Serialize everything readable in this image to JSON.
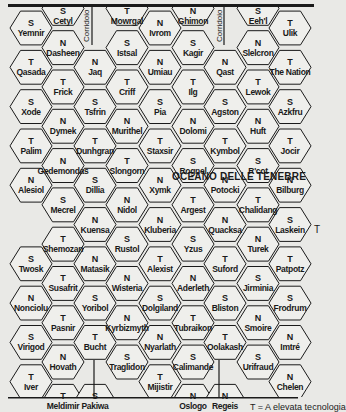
{
  "map": {
    "title": "OCEANO DELLE TENEBRE",
    "corridor_label": "Corridoio",
    "side_marker": "T",
    "legend": "T = A elevata tecnologia",
    "colors": {
      "background": "#e9e9e6",
      "hex_fill": "#efefec",
      "line": "#1a1a1a"
    },
    "hexes": [
      {
        "col": 0,
        "row": 0,
        "type": "S",
        "name": "Yemnir"
      },
      {
        "col": 0,
        "row": 1,
        "type": "T",
        "name": "Qasada"
      },
      {
        "col": 0,
        "row": 2,
        "type": "S",
        "name": "Xode"
      },
      {
        "col": 0,
        "row": 3,
        "type": "T",
        "name": "Palim"
      },
      {
        "col": 0,
        "row": 4,
        "type": "N",
        "name": "Alesiol"
      },
      {
        "col": 0,
        "row": 6,
        "type": "S",
        "name": "Twosk"
      },
      {
        "col": 0,
        "row": 7,
        "type": "N",
        "name": "Nonciolu"
      },
      {
        "col": 0,
        "row": 8,
        "type": "S",
        "name": "Virigod"
      },
      {
        "col": 0,
        "row": 9,
        "type": "T",
        "name": "Iver"
      },
      {
        "col": 1,
        "row": -0.5,
        "type": "S",
        "name": "Cetyl"
      },
      {
        "col": 1,
        "row": 0.5,
        "type": "N",
        "name": "Dasheen"
      },
      {
        "col": 1,
        "row": 1.5,
        "type": "T",
        "name": "Frick"
      },
      {
        "col": 1,
        "row": 2.5,
        "type": "N",
        "name": "Dymek"
      },
      {
        "col": 1,
        "row": 3.5,
        "type": "N",
        "name": "Gedemondas"
      },
      {
        "col": 1,
        "row": 4.5,
        "type": "S",
        "name": "Mecrel"
      },
      {
        "col": 1,
        "row": 5.5,
        "type": "T",
        "name": "Shemozan"
      },
      {
        "col": 1,
        "row": 6.5,
        "type": "T",
        "name": "Susafrit"
      },
      {
        "col": 1,
        "row": 7.5,
        "type": "T",
        "name": "Pasnir"
      },
      {
        "col": 1,
        "row": 8.5,
        "type": "N",
        "name": "Hovath"
      },
      {
        "col": 1,
        "row": 9.5,
        "type": "T",
        "name": "Meldimir"
      },
      {
        "col": 2,
        "row": 1,
        "type": "N",
        "name": "Jaq"
      },
      {
        "col": 2,
        "row": 2,
        "type": "S",
        "name": "Tsfrin"
      },
      {
        "col": 2,
        "row": 3,
        "type": "T",
        "name": "Dunhgran"
      },
      {
        "col": 2,
        "row": 4,
        "type": "S",
        "name": "Dillia"
      },
      {
        "col": 2,
        "row": 5,
        "type": "N",
        "name": "Kuensa"
      },
      {
        "col": 2,
        "row": 6,
        "type": "N",
        "name": "Matasik"
      },
      {
        "col": 2,
        "row": 7,
        "type": "S",
        "name": "Yoribol"
      },
      {
        "col": 2,
        "row": 8,
        "type": "T",
        "name": "Bucht"
      },
      {
        "col": 2,
        "row": 9.5,
        "type": "S",
        "name": "Pakiwa"
      },
      {
        "col": 3,
        "row": -0.5,
        "type": "T",
        "name": "Mowrgal"
      },
      {
        "col": 3,
        "row": 0.5,
        "type": "S",
        "name": "Istsal"
      },
      {
        "col": 3,
        "row": 1.5,
        "type": "T",
        "name": "Criff"
      },
      {
        "col": 3,
        "row": 2.5,
        "type": "N",
        "name": "Murithel"
      },
      {
        "col": 3,
        "row": 3.5,
        "type": "T",
        "name": "Slongorn"
      },
      {
        "col": 3,
        "row": 4.5,
        "type": "N",
        "name": "Nidol"
      },
      {
        "col": 3,
        "row": 5.5,
        "type": "S",
        "name": "Rustol"
      },
      {
        "col": 3,
        "row": 6.5,
        "type": "N",
        "name": "Wisteria"
      },
      {
        "col": 3,
        "row": 7.5,
        "type": "N",
        "name": "Kyrbizmyth"
      },
      {
        "col": 3,
        "row": 8.5,
        "type": "S",
        "name": "Traglidon"
      },
      {
        "col": 4,
        "row": 0,
        "type": "N",
        "name": "Ivrom"
      },
      {
        "col": 4,
        "row": 1,
        "type": "N",
        "name": "Umiau"
      },
      {
        "col": 4,
        "row": 2,
        "type": "S",
        "name": "Pia"
      },
      {
        "col": 4,
        "row": 3,
        "type": "T",
        "name": "Staxsir"
      },
      {
        "col": 4,
        "row": 4,
        "type": "N",
        "name": "Xymk"
      },
      {
        "col": 4,
        "row": 5,
        "type": "N",
        "name": "Kluberia"
      },
      {
        "col": 4,
        "row": 6,
        "type": "T",
        "name": "Alexist"
      },
      {
        "col": 4,
        "row": 7,
        "type": "S",
        "name": "Dolgiland"
      },
      {
        "col": 4,
        "row": 8,
        "type": "N",
        "name": "Nyarlath"
      },
      {
        "col": 4,
        "row": 9,
        "type": "T",
        "name": "Mijistir"
      },
      {
        "col": 5,
        "row": -0.5,
        "type": "N",
        "name": "Ghimon"
      },
      {
        "col": 5,
        "row": 0.5,
        "type": "S",
        "name": "Kagir"
      },
      {
        "col": 5,
        "row": 1.5,
        "type": "T",
        "name": "Ilg"
      },
      {
        "col": 5,
        "row": 2.5,
        "type": "N",
        "name": "Dolomi"
      },
      {
        "col": 5,
        "row": 3.5,
        "type": "S",
        "name": "Rognel"
      },
      {
        "col": 5,
        "row": 4.5,
        "type": "T",
        "name": "Argest"
      },
      {
        "col": 5,
        "row": 5.5,
        "type": "S",
        "name": "Yzus"
      },
      {
        "col": 5,
        "row": 6.5,
        "type": "N",
        "name": "Aderleth"
      },
      {
        "col": 5,
        "row": 7.5,
        "type": "T",
        "name": "Tubraikon"
      },
      {
        "col": 5,
        "row": 8.5,
        "type": "S",
        "name": "Calimande"
      },
      {
        "col": 5,
        "row": 9.5,
        "type": "N",
        "name": "Oslogo"
      },
      {
        "col": 6,
        "row": 1,
        "type": "N",
        "name": "Qast"
      },
      {
        "col": 6,
        "row": 2,
        "type": "S",
        "name": "Agston"
      },
      {
        "col": 6,
        "row": 3,
        "type": "T",
        "name": "Kymbol"
      },
      {
        "col": 6,
        "row": 4,
        "type": "N",
        "name": "Potocki"
      },
      {
        "col": 6,
        "row": 5,
        "type": "N",
        "name": "Quacksa"
      },
      {
        "col": 6,
        "row": 6,
        "type": "T",
        "name": "Suford"
      },
      {
        "col": 6,
        "row": 7,
        "type": "S",
        "name": "Bliston"
      },
      {
        "col": 6,
        "row": 8,
        "type": "T",
        "name": "Oolakash"
      },
      {
        "col": 6,
        "row": 9.5,
        "type": "N",
        "name": "Regeis"
      },
      {
        "col": 7,
        "row": -0.5,
        "type": "S",
        "name": "Eeh'l"
      },
      {
        "col": 7,
        "row": 0.5,
        "type": "N",
        "name": "Slelcron"
      },
      {
        "col": 7,
        "row": 1.5,
        "type": "T",
        "name": "Lewok"
      },
      {
        "col": 7,
        "row": 2.5,
        "type": "N",
        "name": "Huft"
      },
      {
        "col": 7,
        "row": 3.5,
        "type": "S",
        "name": "R'cot"
      },
      {
        "col": 7,
        "row": 4.5,
        "type": "T",
        "name": "Chalidang"
      },
      {
        "col": 7,
        "row": 5.5,
        "type": "N",
        "name": "Turek"
      },
      {
        "col": 7,
        "row": 6.5,
        "type": "S",
        "name": "Jirminia"
      },
      {
        "col": 7,
        "row": 7.5,
        "type": "N",
        "name": "Smoire"
      },
      {
        "col": 7,
        "row": 8.5,
        "type": "S",
        "name": "Urifraud"
      },
      {
        "col": 8,
        "row": 0,
        "type": "T",
        "name": "Ulik"
      },
      {
        "col": 8,
        "row": 1,
        "type": "T",
        "name": "The Nation"
      },
      {
        "col": 8,
        "row": 2,
        "type": "S",
        "name": "Azkfru"
      },
      {
        "col": 8,
        "row": 3,
        "type": "T",
        "name": "Jocir"
      },
      {
        "col": 8,
        "row": 4,
        "type": "N",
        "name": "Bilburg"
      },
      {
        "col": 8,
        "row": 5,
        "type": "S",
        "name": "Laskein"
      },
      {
        "col": 8,
        "row": 6,
        "type": "T",
        "name": "Patpotz"
      },
      {
        "col": 8,
        "row": 7,
        "type": "S",
        "name": "Frodrum"
      },
      {
        "col": 8,
        "row": 8,
        "type": "N",
        "name": "Imtré"
      },
      {
        "col": 8,
        "row": 9,
        "type": "N",
        "name": "Chelen"
      }
    ]
  }
}
